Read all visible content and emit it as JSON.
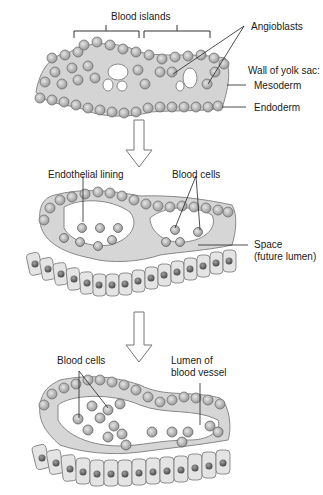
{
  "diagram": {
    "stages": [
      {
        "id": "stage-1",
        "labels": {
          "blood_islands": "Blood islands",
          "angioblasts": "Angioblasts",
          "wall_of_yolk_sac": "Wall of yolk sac:",
          "mesoderm": "Mesoderm",
          "endoderm": "Endoderm"
        }
      },
      {
        "id": "stage-2",
        "labels": {
          "endothelial_lining": "Endothelial lining",
          "blood_cells": "Blood cells",
          "space_line1": "Space",
          "space_line2": "(future lumen)"
        }
      },
      {
        "id": "stage-3",
        "labels": {
          "blood_cells": "Blood cells",
          "lumen_line1": "Lumen of",
          "lumen_line2": "blood vessel"
        }
      }
    ],
    "arrows": [
      "down-arrow-1",
      "down-arrow-2"
    ],
    "colors": {
      "tissue": "#d9d9d9",
      "cell_fill": "#bdbdbd",
      "nucleus": "#6b6b6b",
      "outline": "#7a7a7a",
      "lumen": "#ffffff",
      "label_text": "#1a1a1a"
    }
  }
}
